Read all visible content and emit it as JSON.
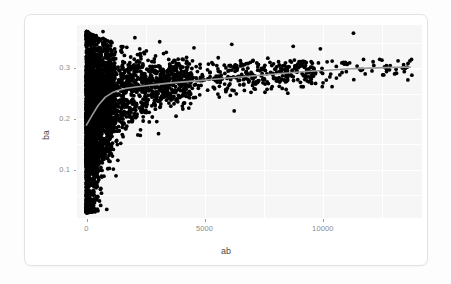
{
  "card": {
    "name": "plot-card"
  },
  "chart_data": {
    "type": "scatter",
    "title": "",
    "subtitle": "",
    "xlabel": "ab",
    "ylabel": "ba",
    "xlim": [
      -400,
      14200
    ],
    "ylim": [
      0.005,
      0.385
    ],
    "xticks": [
      0,
      5000,
      10000
    ],
    "xticklabels": [
      "0",
      "5000",
      "10000"
    ],
    "yticks": [
      0.1,
      0.2,
      0.3
    ],
    "yticklabels": [
      "0.1",
      "0.2",
      "0.3"
    ],
    "grid": true,
    "grid_color": "#ffffff",
    "panel_background": "#f6f6f6",
    "point_color": "#000000",
    "point_size": 2.0,
    "legend": "none",
    "n_points_approx": 4000,
    "series": [
      {
        "name": "points",
        "type": "scatter",
        "color": "#000000",
        "marker": "circle"
      },
      {
        "name": "loess-smooth",
        "type": "line",
        "color": "#9a9a9a",
        "linewidth": 1.6,
        "x": [
          0,
          250,
          500,
          800,
          1100,
          1400,
          1700,
          2000,
          2500,
          3000,
          3500,
          4000,
          5000,
          6000,
          7000,
          8000,
          9000,
          10000,
          11000,
          12000,
          13000,
          13700
        ],
        "y": [
          0.188,
          0.208,
          0.227,
          0.243,
          0.252,
          0.257,
          0.2605,
          0.2625,
          0.2655,
          0.268,
          0.2705,
          0.2725,
          0.2765,
          0.2805,
          0.2845,
          0.2885,
          0.2925,
          0.2955,
          0.2985,
          0.3,
          0.3015,
          0.302
        ]
      }
    ]
  },
  "axes": {
    "y_label": "ba",
    "x_label": "ab"
  }
}
